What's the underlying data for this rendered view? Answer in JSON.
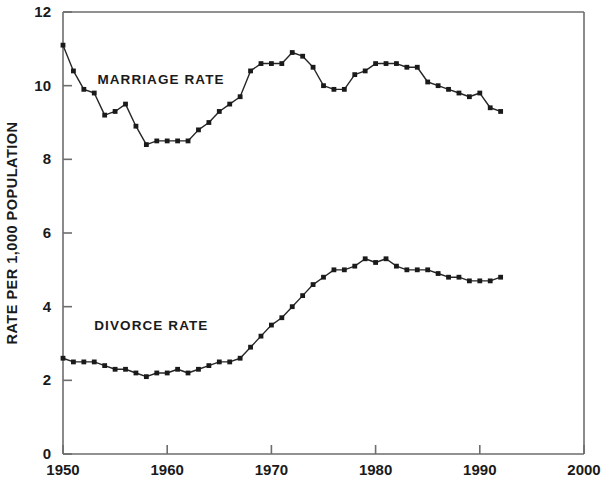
{
  "chart_data": {
    "type": "line",
    "title": "",
    "xlabel": "",
    "ylabel": "RATE PER 1,000 POPULATION",
    "xlim": [
      1950,
      2000
    ],
    "ylim": [
      0,
      12
    ],
    "xticks": [
      1950,
      1960,
      1970,
      1980,
      1990,
      2000
    ],
    "xtick_labels": [
      "1950",
      "1960",
      "1970",
      "1980",
      "1990",
      "2000"
    ],
    "yticks": [
      0,
      2,
      4,
      6,
      8,
      10,
      12
    ],
    "ytick_labels": [
      "0",
      "2",
      "4",
      "6",
      "8",
      "10",
      "12"
    ],
    "grid": false,
    "legend": "inline-annotations",
    "marker": "square",
    "line_color": "#262626",
    "marker_color": "#1a1a1a",
    "axis_color": "#6d6d6d",
    "background": "#ffffff",
    "x": [
      1950,
      1951,
      1952,
      1953,
      1954,
      1955,
      1956,
      1957,
      1958,
      1959,
      1960,
      1961,
      1962,
      1963,
      1964,
      1965,
      1966,
      1967,
      1968,
      1969,
      1970,
      1971,
      1972,
      1973,
      1974,
      1975,
      1976,
      1977,
      1978,
      1979,
      1980,
      1981,
      1982,
      1983,
      1984,
      1985,
      1986,
      1987,
      1988,
      1989,
      1990,
      1991,
      1992
    ],
    "series": [
      {
        "name": "MARRIAGE RATE",
        "label_x": 1953.3,
        "label_y": 10.05,
        "values": [
          11.1,
          10.4,
          9.9,
          9.8,
          9.2,
          9.3,
          9.5,
          8.9,
          8.4,
          8.5,
          8.5,
          8.5,
          8.5,
          8.8,
          9.0,
          9.3,
          9.5,
          9.7,
          10.4,
          10.6,
          10.6,
          10.6,
          10.9,
          10.8,
          10.5,
          10.0,
          9.9,
          9.9,
          10.3,
          10.4,
          10.6,
          10.6,
          10.6,
          10.5,
          10.5,
          10.1,
          10.0,
          9.9,
          9.8,
          9.7,
          9.8,
          9.4,
          9.3
        ]
      },
      {
        "name": "DIVORCE RATE",
        "label_x": 1953.0,
        "label_y": 3.38,
        "values": [
          2.6,
          2.5,
          2.5,
          2.5,
          2.4,
          2.3,
          2.3,
          2.2,
          2.1,
          2.2,
          2.2,
          2.3,
          2.2,
          2.3,
          2.4,
          2.5,
          2.5,
          2.6,
          2.9,
          3.2,
          3.5,
          3.7,
          4.0,
          4.3,
          4.6,
          4.8,
          5.0,
          5.0,
          5.1,
          5.3,
          5.2,
          5.3,
          5.1,
          5.0,
          5.0,
          5.0,
          4.9,
          4.8,
          4.8,
          4.7,
          4.7,
          4.7,
          4.8
        ]
      }
    ]
  }
}
